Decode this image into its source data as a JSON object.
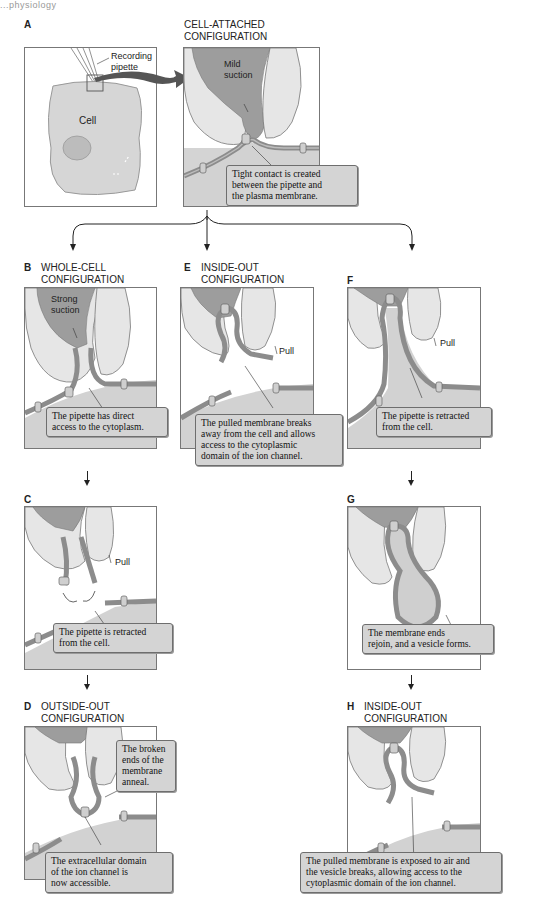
{
  "header": {
    "cut_text": "...physiology"
  },
  "colors": {
    "pipette_inner": "#9a9a9a",
    "pipette_glass": "#d9d9d9",
    "cytoplasm": "#cfcfcf",
    "membrane": "#8c8c8c",
    "callout_bg": "#d4d4d4",
    "panel_border": "#777777",
    "big_arrow": "#555555"
  },
  "panels": {
    "A": {
      "letter": "A",
      "title": "",
      "labels": {
        "pipette": "Recording\npipette",
        "pipette_line1": "Recording",
        "pipette_line2": "pipette",
        "cell": "Cell"
      }
    },
    "cell_attached": {
      "letter": "",
      "title_line1": "CELL-ATTACHED",
      "title_line2": "CONFIGURATION",
      "suction_line1": "Mild",
      "suction_line2": "suction",
      "callout": [
        "Tight contact is created",
        "between the pipette and",
        "the plasma membrane."
      ]
    },
    "B": {
      "letter": "B",
      "title_line1": "WHOLE-CELL",
      "title_line2": "CONFIGURATION",
      "suction_line1": "Strong",
      "suction_line2": "suction",
      "callout": [
        "The pipette has direct",
        "access to the cytoplasm."
      ]
    },
    "E": {
      "letter": "E",
      "title_line1": "INSIDE-OUT",
      "title_line2": "CONFIGURATION",
      "pull": "Pull",
      "callout": [
        "The pulled membrane  breaks",
        "away from the cell and allows",
        "access to the cytoplasmic",
        "domain of the ion channel."
      ]
    },
    "F": {
      "letter": "F",
      "title_line1": "",
      "title_line2": "",
      "pull": "Pull",
      "callout": [
        "The pipette is retracted",
        "from the cell."
      ]
    },
    "C": {
      "letter": "C",
      "pull": "Pull",
      "callout": [
        "The pipette is retracted",
        "from the cell."
      ]
    },
    "G": {
      "letter": "G",
      "callout": [
        "The membrane ends",
        "rejoin, and a vesicle forms."
      ]
    },
    "D": {
      "letter": "D",
      "title_line1": "OUTSIDE-OUT",
      "title_line2": "CONFIGURATION",
      "callout_top": [
        "The broken",
        "ends of the",
        "membrane",
        "anneal."
      ],
      "callout_bottom": [
        "The extracellular domain",
        "of the ion channel is",
        "now accessible."
      ]
    },
    "H": {
      "letter": "H",
      "title_line1": "INSIDE-OUT",
      "title_line2": "CONFIGURATION",
      "callout": [
        "The pulled membrane is exposed to air and",
        "the vesicle breaks, allowing access to the",
        "cytoplasmic domain of the ion channel."
      ]
    }
  }
}
